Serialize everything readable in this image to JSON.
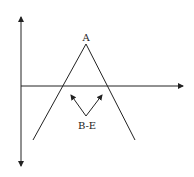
{
  "diagram": {
    "peak_label": "A",
    "arrow_label": "B-E",
    "colors": {
      "line": "#222222",
      "background": "#ffffff"
    }
  }
}
